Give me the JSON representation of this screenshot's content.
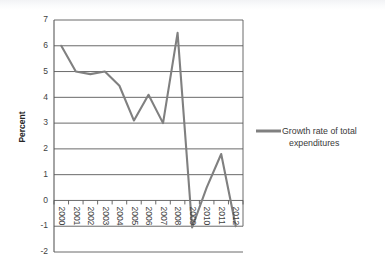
{
  "chart_data": {
    "type": "line",
    "title": "",
    "subtitle": "",
    "xlabel": "",
    "ylabel": "Percent",
    "categories": [
      "2000",
      "2001",
      "2002",
      "2003",
      "2004",
      "2005",
      "2006",
      "2007",
      "2008",
      "2009",
      "2010",
      "2011",
      "2012"
    ],
    "series": [
      {
        "name": "Growth rate of total expenditures",
        "color": "#808080",
        "values": [
          6.0,
          5.0,
          4.9,
          5.0,
          4.45,
          3.1,
          4.1,
          3.0,
          6.5,
          -1.05,
          0.5,
          1.8,
          -1.0
        ]
      }
    ],
    "ylim": [
      -2,
      7
    ],
    "yticks": [
      -2,
      -1,
      0,
      1,
      2,
      3,
      4,
      5,
      6,
      7
    ],
    "ytick_labels": [
      "-2",
      "-1",
      "0",
      "1",
      "2",
      "3",
      "4",
      "5",
      "6",
      "7"
    ],
    "grid": "horizontal",
    "grid_color": "#595959",
    "legend_position": "right",
    "plot_border": "box",
    "background_color": "#ffffff"
  },
  "legend": {
    "entries": [
      {
        "label_line1": "Growth rate of total",
        "label_line2": "expenditures",
        "swatch_color": "#808080"
      }
    ]
  },
  "axes": {
    "y_axis_title": "Percent"
  }
}
